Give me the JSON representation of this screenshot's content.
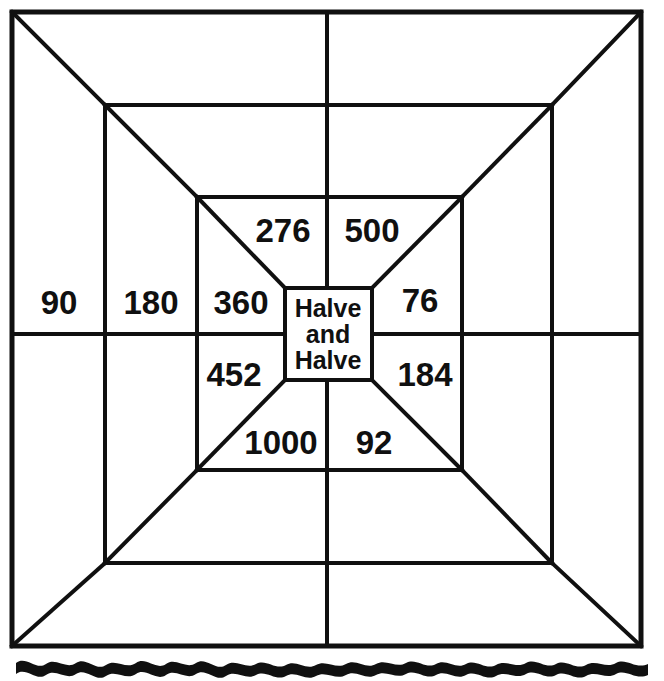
{
  "document": {
    "title": "Halve and Halve",
    "background_color": "#ffffff",
    "ink_color": "#101010"
  },
  "center": {
    "line1": "Halve",
    "line2": "and",
    "line3": "Halve"
  },
  "cells": {
    "left_outer": "90",
    "left_mid": "180",
    "left_inner": "360",
    "top_inner_left": "276",
    "top_inner_right": "500",
    "right_inner_upper": "76",
    "right_inner_lower": "184",
    "left_inner_lower": "452",
    "bottom_inner_left": "1000",
    "bottom_inner_right": "92",
    "top_mid_left": "",
    "top_mid_right": "",
    "top_outer_left": "",
    "top_outer_right": "",
    "right_mid_upper": "",
    "right_mid_lower": "",
    "right_outer_upper": "",
    "right_outer_lower": "",
    "bottom_mid_left": "",
    "bottom_mid_right": "",
    "bottom_outer_left": "",
    "bottom_outer_right": ""
  },
  "decoration": {
    "wave_name": "wavy-rule",
    "cropped_header_text": ""
  },
  "geometry": {
    "outer": {
      "x1": 12,
      "y1": 12,
      "x2": 641,
      "y2": 646
    },
    "ring2": {
      "x1": 105,
      "y1": 105,
      "x2": 552,
      "y2": 563
    },
    "ring3": {
      "x1": 197,
      "y1": 197,
      "x2": 462,
      "y2": 470
    },
    "center_box": {
      "x1": 285,
      "y1": 288,
      "x2": 372,
      "y2": 380
    },
    "center_v": 327,
    "center_h": 334
  }
}
